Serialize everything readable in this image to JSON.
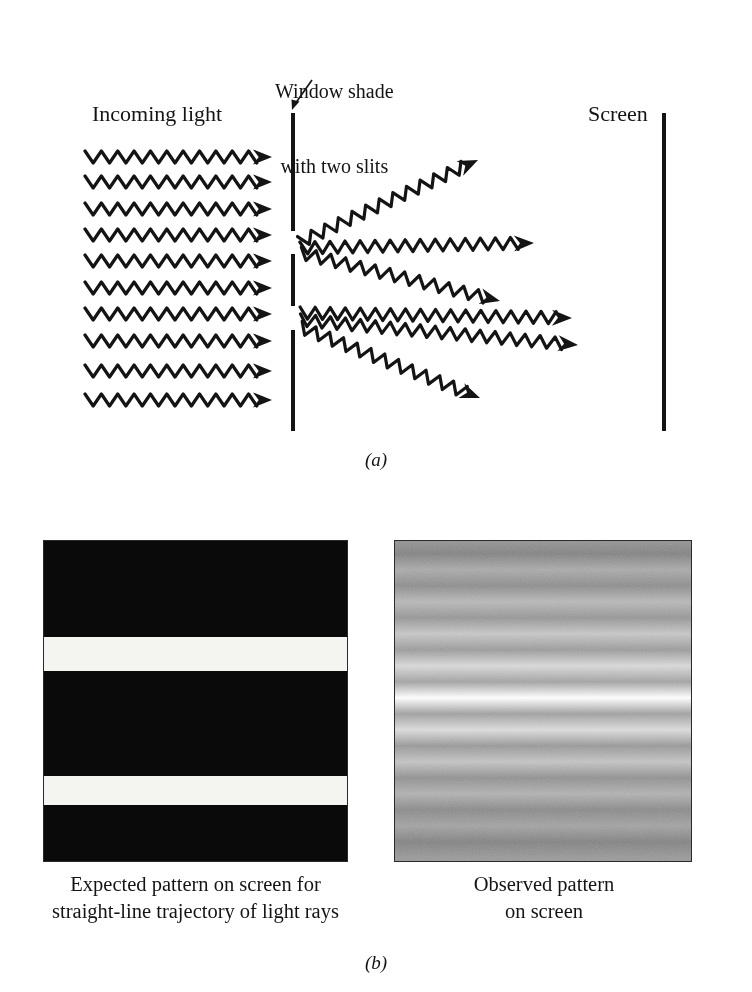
{
  "figure": {
    "ink_color": "#141414",
    "background_color": "#ffffff"
  },
  "panel_a": {
    "letter": "(a)",
    "labels": {
      "incoming_light": "Incoming light",
      "screen": "Screen",
      "window_shade_line1": "Window shade",
      "window_shade_line2": "with two slits"
    },
    "barrier": {
      "x": 291,
      "width": 4,
      "segments": [
        {
          "name": "top-segment",
          "top": 113,
          "height": 118
        },
        {
          "name": "middle-segment",
          "top": 254,
          "height": 52
        },
        {
          "name": "bottom-segment",
          "top": 330,
          "height": 101
        }
      ],
      "slits": [
        {
          "name": "upper-slit",
          "top": 231,
          "height": 23
        },
        {
          "name": "lower-slit",
          "top": 306,
          "height": 24
        }
      ]
    },
    "screen_line": {
      "x": 662,
      "top": 113,
      "height": 318
    },
    "incoming_waves": {
      "count": 10,
      "x_start": 85,
      "x_end": 272,
      "y_values": [
        157,
        182,
        209,
        235,
        261,
        288,
        314,
        341,
        371,
        400
      ],
      "wavelength": 16,
      "amplitude": 6,
      "arrowhead": "filled-triangle-right"
    },
    "diffracted_waves": [
      {
        "name": "upper-slit-wave-up",
        "from_slit": "upper-slit",
        "x1": 300,
        "y1": 242,
        "x2": 478,
        "y2": 160
      },
      {
        "name": "upper-slit-wave-straight",
        "from_slit": "upper-slit",
        "x1": 300,
        "y1": 248,
        "x2": 534,
        "y2": 243
      },
      {
        "name": "upper-slit-wave-down",
        "from_slit": "upper-slit",
        "x1": 300,
        "y1": 253,
        "x2": 500,
        "y2": 301
      },
      {
        "name": "lower-slit-wave-up",
        "from_slit": "lower-slit",
        "x1": 300,
        "y1": 313,
        "x2": 572,
        "y2": 318
      },
      {
        "name": "lower-slit-wave-straight",
        "from_slit": "lower-slit",
        "x1": 300,
        "y1": 320,
        "x2": 578,
        "y2": 345
      },
      {
        "name": "lower-slit-wave-down",
        "from_slit": "lower-slit",
        "x1": 300,
        "y1": 327,
        "x2": 480,
        "y2": 398
      }
    ]
  },
  "panel_b": {
    "letter": "(b)",
    "expected": {
      "caption_line1": "Expected pattern on screen for",
      "caption_line2": "straight-line trajectory of light rays",
      "background_color": "#0a0a0a",
      "band_color": "#f4f4f0",
      "bands": [
        {
          "name": "upper-bright-band",
          "top_pct": 30.0,
          "height_pct": 10.5
        },
        {
          "name": "lower-bright-band",
          "top_pct": 73.5,
          "height_pct": 9.0
        }
      ]
    },
    "observed": {
      "caption_line1": "Observed pattern",
      "caption_line2": "on screen",
      "description": "interference fringes with bright central maximum",
      "fringe_count": 11
    }
  },
  "chart_data": {
    "type": "line",
    "xlabel": "Relative intensity",
    "ylabel": "Position on screen (% from top of panel)",
    "grid": false,
    "legend": "none",
    "ylim": [
      0,
      100
    ],
    "xlim": [
      0,
      1
    ],
    "series": [
      {
        "name": "Expected pattern (geometric shadow, two sharp bands)",
        "panel": "expected",
        "x": [
          0,
          29.9,
          30.0,
          40.4,
          40.5,
          73.4,
          73.5,
          82.4,
          82.5,
          100
        ],
        "values": [
          0,
          0,
          1,
          1,
          0,
          0,
          1,
          1,
          0,
          0
        ]
      },
      {
        "name": "Observed pattern (interference fringes)",
        "panel": "observed",
        "x": [
          0,
          4,
          9,
          14,
          19,
          24,
          29,
          34,
          39,
          44,
          49,
          54,
          59,
          64,
          69,
          74,
          79,
          84,
          89,
          94,
          99
        ],
        "values": [
          0.4,
          0.3,
          0.52,
          0.36,
          0.6,
          0.41,
          0.68,
          0.44,
          0.78,
          0.48,
          1.0,
          0.46,
          0.8,
          0.42,
          0.66,
          0.38,
          0.56,
          0.34,
          0.48,
          0.3,
          0.42
        ]
      }
    ],
    "fringe_peaks_pct": [
      8,
      18,
      27,
      36,
      45,
      50,
      57,
      66,
      74,
      83,
      92
    ]
  }
}
